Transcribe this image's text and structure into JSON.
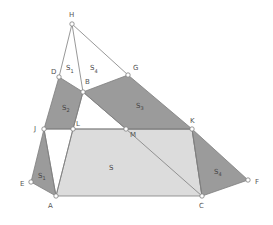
{
  "diagram": {
    "colors": {
      "dark_fill": "#9b9b9b",
      "light_fill": "#dcdcdc",
      "stroke": "#7d7d7d",
      "point_fill": "#ffffff",
      "label": "#555555"
    },
    "points": {
      "H": {
        "label": "H",
        "x": 72,
        "y": 24,
        "lx": 69,
        "ly": 17
      },
      "D": {
        "label": "D",
        "x": 59,
        "y": 77,
        "lx": 51,
        "ly": 74
      },
      "B": {
        "label": "B",
        "x": 83,
        "y": 92,
        "lx": 85,
        "ly": 84
      },
      "G": {
        "label": "G",
        "x": 128,
        "y": 75,
        "lx": 133,
        "ly": 70
      },
      "J": {
        "label": "J",
        "x": 44,
        "y": 129,
        "lx": 34,
        "ly": 131
      },
      "L": {
        "label": "L",
        "x": 73,
        "y": 129,
        "lx": 76,
        "ly": 126
      },
      "M": {
        "label": "M",
        "x": 126,
        "y": 129,
        "lx": 130,
        "ly": 137
      },
      "K": {
        "label": "K",
        "x": 192,
        "y": 129,
        "lx": 190,
        "ly": 123
      },
      "E": {
        "label": "E",
        "x": 31,
        "y": 182,
        "lx": 20,
        "ly": 186
      },
      "A": {
        "label": "A",
        "x": 56,
        "y": 196,
        "lx": 48,
        "ly": 208
      },
      "C": {
        "label": "C",
        "x": 202,
        "y": 196,
        "lx": 199,
        "ly": 208
      },
      "F": {
        "label": "F",
        "x": 248,
        "y": 180,
        "lx": 255,
        "ly": 184
      }
    },
    "regions": [
      {
        "name": "S2",
        "label": "S",
        "sub": "2",
        "lx": 62,
        "ly": 110
      },
      {
        "name": "S3",
        "label": "S",
        "sub": "3",
        "lx": 136,
        "ly": 108
      },
      {
        "name": "S1-bottom",
        "label": "S",
        "sub": "1",
        "lx": 38,
        "ly": 178
      },
      {
        "name": "S4-bottom",
        "label": "S",
        "sub": "4",
        "lx": 214,
        "ly": 174
      },
      {
        "name": "S",
        "label": "S",
        "sub": "",
        "lx": 109,
        "ly": 170
      },
      {
        "name": "S1-top",
        "label": "S",
        "sub": "1",
        "lx": 66,
        "ly": 70
      },
      {
        "name": "S4-top",
        "label": "S",
        "sub": "4",
        "lx": 90,
        "ly": 70
      }
    ]
  }
}
